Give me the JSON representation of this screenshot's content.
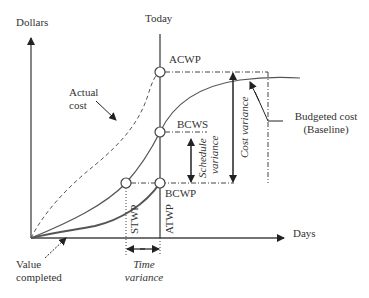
{
  "axes": {
    "y_label": "Dollars",
    "x_label": "Days",
    "today_label": "Today"
  },
  "points": {
    "acwp": "ACWP",
    "bcws": "BCWS",
    "bcwp": "BCWP"
  },
  "curves": {
    "actual_cost_line1": "Actual",
    "actual_cost_line2": "cost",
    "budgeted_line1": "Budgeted cost",
    "budgeted_line2": "(Baseline)",
    "value_line1": "Value",
    "value_line2": "completed"
  },
  "variances": {
    "cost": "Cost variance",
    "schedule_line1": "Schedule",
    "schedule_line2": "variance",
    "time_line1": "Time",
    "time_line2": "variance"
  },
  "time_markers": {
    "stwp": "STWP",
    "atwp": "ATWP"
  },
  "colors": {
    "line": "#444444",
    "text": "#333333"
  }
}
